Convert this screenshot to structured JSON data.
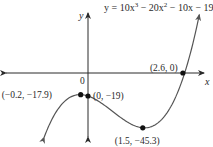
{
  "chart_data": {
    "type": "line",
    "title": "",
    "equation": "y = 10x³ − 20x² − 10x − 19",
    "equation_parts": {
      "lhs": "y = 10x",
      "exp1": "3",
      "mid1": " − 20x",
      "exp2": "2",
      "rest": " − 10x − 19"
    },
    "function": {
      "a3": 10,
      "a2": -20,
      "a1": -10,
      "a0": -19
    },
    "xlabel": "x",
    "ylabel": "y",
    "origin_label": "0",
    "xlim": [
      -2.4,
      3.2
    ],
    "ylim": [
      -60,
      60
    ],
    "grid": false,
    "curve_domain": [
      -1.2,
      3.05
    ],
    "points": [
      {
        "x": -0.2,
        "y": -17.9,
        "label": "(−0.2, −17.9)",
        "role": "local maximum"
      },
      {
        "x": 0,
        "y": -19,
        "label": "(0, −19)",
        "role": "y-intercept"
      },
      {
        "x": 1.5,
        "y": -45.3,
        "label": "(1.5, −45.3)",
        "role": "local minimum"
      },
      {
        "x": 2.6,
        "y": 0,
        "label": "(2.6, 0)",
        "role": "x-intercept"
      }
    ],
    "annotations": [
      {
        "text": "y = 10x³ − 20x² − 10x − 19",
        "points_to": "curve upper-right end"
      }
    ]
  },
  "colors": {
    "axis": "#2a2a2a",
    "curve": "#555555",
    "point": "#111111",
    "text": "#2a2a2a"
  }
}
